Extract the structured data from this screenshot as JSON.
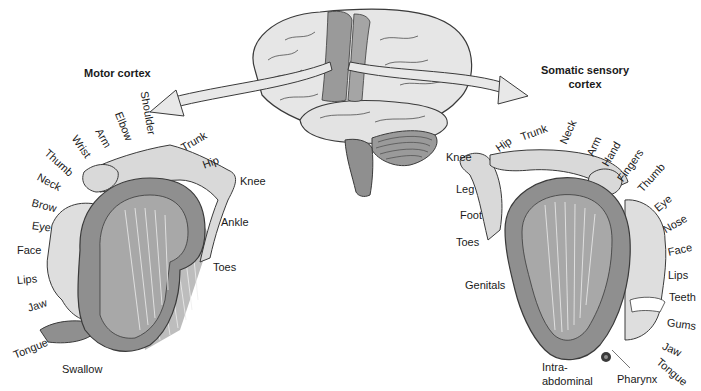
{
  "diagram": {
    "colors": {
      "cortex_dark": "#8f8f8f",
      "cortex_mid": "#a8a8a8",
      "body_light": "#d9d9d9",
      "brain_light": "#e6e6e6",
      "strip": "#9a9a9a",
      "outline": "#3a3a3a",
      "arrow_fill": "#e8e8e8"
    },
    "center_brain": {
      "label": "Brain (lateral view) with motor and somatosensory strips"
    },
    "motor": {
      "title": "Motor cortex",
      "labels": [
        {
          "text": "Shoulder",
          "x": 144,
          "y": 86,
          "rot": 80
        },
        {
          "text": "Elbow",
          "x": 118,
          "y": 107,
          "rot": 68
        },
        {
          "text": "Arm",
          "x": 98,
          "y": 124,
          "rot": 60
        },
        {
          "text": "Wrist",
          "x": 74,
          "y": 131,
          "rot": 55
        },
        {
          "text": "Thumb",
          "x": 46,
          "y": 146,
          "rot": 42
        },
        {
          "text": "Neck",
          "x": 38,
          "y": 171,
          "rot": 28
        },
        {
          "text": "Brow",
          "x": 32,
          "y": 197,
          "rot": 15
        },
        {
          "text": "Eye",
          "x": 32,
          "y": 220,
          "rot": 8
        },
        {
          "text": "Face",
          "x": 17,
          "y": 245,
          "rot": 0
        },
        {
          "text": "Lips",
          "x": 17,
          "y": 275,
          "rot": -5
        },
        {
          "text": "Jaw",
          "x": 28,
          "y": 303,
          "rot": -18
        },
        {
          "text": "Tongue",
          "x": 14,
          "y": 350,
          "rot": -22
        },
        {
          "text": "Swallow",
          "x": 62,
          "y": 364,
          "rot": 0
        },
        {
          "text": "Trunk",
          "x": 182,
          "y": 143,
          "rot": -30
        },
        {
          "text": "Hip",
          "x": 203,
          "y": 160,
          "rot": -20
        },
        {
          "text": "Knee",
          "x": 240,
          "y": 176,
          "rot": 0
        },
        {
          "text": "Ankle",
          "x": 221,
          "y": 217,
          "rot": 0
        },
        {
          "text": "Toes",
          "x": 213,
          "y": 262,
          "rot": 0
        }
      ]
    },
    "sensory": {
      "title_line1": "Somatic sensory",
      "title_line2": "cortex",
      "labels": [
        {
          "text": "Knee",
          "x": 446,
          "y": 152,
          "rot": 0
        },
        {
          "text": "Hip",
          "x": 497,
          "y": 144,
          "rot": -35
        },
        {
          "text": "Trunk",
          "x": 521,
          "y": 132,
          "rot": -20
        },
        {
          "text": "Neck",
          "x": 563,
          "y": 138,
          "rot": -65
        },
        {
          "text": "Arm",
          "x": 590,
          "y": 150,
          "rot": -65
        },
        {
          "text": "Hand",
          "x": 605,
          "y": 160,
          "rot": -60
        },
        {
          "text": "Fingers",
          "x": 620,
          "y": 175,
          "rot": -55
        },
        {
          "text": "Thumb",
          "x": 640,
          "y": 185,
          "rot": -48
        },
        {
          "text": "Eye",
          "x": 656,
          "y": 204,
          "rot": -40
        },
        {
          "text": "Nose",
          "x": 664,
          "y": 225,
          "rot": -30
        },
        {
          "text": "Face",
          "x": 668,
          "y": 247,
          "rot": -12
        },
        {
          "text": "Lips",
          "x": 668,
          "y": 270,
          "rot": 0
        },
        {
          "text": "Teeth",
          "x": 669,
          "y": 292,
          "rot": 0
        },
        {
          "text": "Gums",
          "x": 667,
          "y": 317,
          "rot": 8
        },
        {
          "text": "Jaw",
          "x": 663,
          "y": 340,
          "rot": 25
        },
        {
          "text": "Tongue",
          "x": 658,
          "y": 355,
          "rot": 40
        },
        {
          "text": "Leg",
          "x": 456,
          "y": 184,
          "rot": 0
        },
        {
          "text": "Foot",
          "x": 460,
          "y": 210,
          "rot": 0
        },
        {
          "text": "Toes",
          "x": 456,
          "y": 237,
          "rot": 0
        },
        {
          "text": "Genitals",
          "x": 465,
          "y": 280,
          "rot": 0
        },
        {
          "text": "Intra-",
          "x": 542,
          "y": 362,
          "rot": 0
        },
        {
          "text": "abdominal",
          "x": 542,
          "y": 376,
          "rot": 0
        },
        {
          "text": "Pharynx",
          "x": 617,
          "y": 374,
          "rot": 0
        }
      ]
    }
  }
}
